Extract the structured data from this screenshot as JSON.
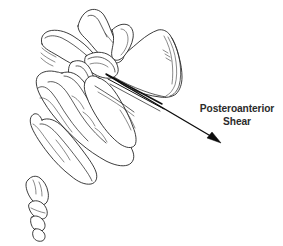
{
  "figure": {
    "background_color": "#ffffff",
    "line_color": "#1a1a1a",
    "text_color": "#2b2b2b"
  },
  "annotation": {
    "label_line_1": "Posteroanterior",
    "label_line_2": "Shear",
    "arrow": {
      "name": "posteroanterior-shear-arrow",
      "direction": "down-right",
      "start_x": 107,
      "start_y": 75,
      "end_x": 221,
      "end_y": 143,
      "color": "#0d0d0d"
    }
  },
  "anatomy": {
    "parts": [
      {
        "name": "l5-vertebral-body",
        "label": "L5 vertebral body"
      },
      {
        "name": "l5-spinous-process",
        "label": "L5 spinous process"
      },
      {
        "name": "l5-superior-articular-process",
        "label": "Superior articular process"
      },
      {
        "name": "l5-transverse-process",
        "label": "Transverse process"
      },
      {
        "name": "sacrum",
        "label": "Sacrum"
      },
      {
        "name": "sacral-ala",
        "label": "Sacral ala"
      },
      {
        "name": "coccyx",
        "label": "Coccyx"
      },
      {
        "name": "lumbosacral-disc-plane",
        "label": "Lumbosacral disc plane"
      }
    ]
  }
}
